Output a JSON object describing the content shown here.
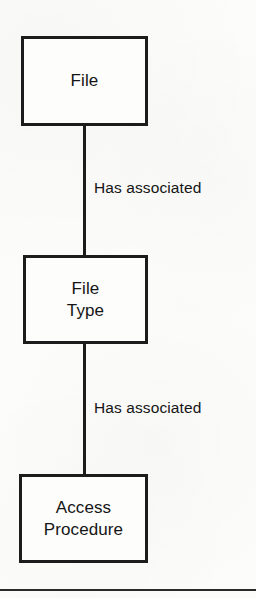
{
  "diagram": {
    "type": "entity-relationship-diagram",
    "background_color": "#fcfcfb",
    "stroke_color": "#1c1c1c",
    "text_color": "#151515",
    "entities": [
      {
        "id": "file",
        "label": "File"
      },
      {
        "id": "file-type",
        "label": "File\nType"
      },
      {
        "id": "access-procedure",
        "label": "Access\nProcedure"
      }
    ],
    "relationships": [
      {
        "id": "file-has-file-type",
        "label": "Has associated",
        "from": "file",
        "to": "file-type"
      },
      {
        "id": "file-type-has-access-procedure",
        "label": "Has associated",
        "from": "file-type",
        "to": "access-procedure"
      }
    ],
    "footer_rule": {
      "present": true
    }
  }
}
